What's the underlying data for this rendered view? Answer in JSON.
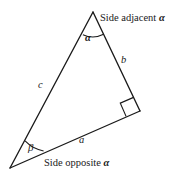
{
  "figure": {
    "background_color": "#ffffff",
    "stroke_color": "#1a1a1a",
    "labels": {
      "side_adjacent_prefix": "Side adjacent ",
      "side_adjacent_symbol": "α",
      "side_opposite_prefix": "Side opposite ",
      "side_opposite_symbol": "α",
      "side_a": "a",
      "side_b": "b",
      "side_c": "c",
      "angle_alpha": "α",
      "angle_beta": "β"
    },
    "vertices": {
      "apex": "93,12",
      "right_angle": "140,111",
      "lower_left": "10,168"
    },
    "markers": {
      "right_angle_marker": "square",
      "alpha_arc": "arc",
      "beta_arc": "arc"
    }
  }
}
